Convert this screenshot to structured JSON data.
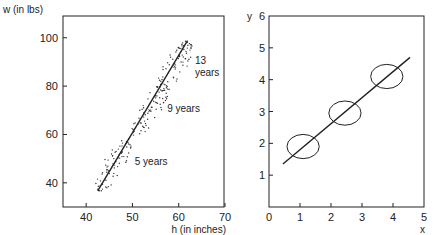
{
  "chart_data": [
    {
      "type": "scatter",
      "title": "",
      "xlabel": "h (in inches)",
      "ylabel": "w (in lbs)",
      "xlim": [
        35,
        70
      ],
      "ylim": [
        30,
        109
      ],
      "xticks": [
        40,
        50,
        60,
        70
      ],
      "yticks": [
        40,
        60,
        80,
        100
      ],
      "grid": false,
      "legend": null,
      "clusters": [
        {
          "label": "5 years",
          "center_h": 46,
          "center_w": 47.5,
          "spread_h": 3.2,
          "spread_w": 9,
          "count": 70
        },
        {
          "label": "9 years",
          "center_h": 53.8,
          "center_w": 70,
          "spread_h": 3.2,
          "spread_w": 10,
          "count": 70
        },
        {
          "label": "13 years",
          "center_h": 59.2,
          "center_w": 88,
          "spread_h": 3.2,
          "spread_w": 11,
          "count": 70
        }
      ],
      "regression_line": {
        "x": [
          42.5,
          61.9
        ],
        "y": [
          36.7,
          98.8
        ]
      },
      "annotations": [
        {
          "text": "5 years",
          "h": 50.5,
          "w": 47.5
        },
        {
          "text": "9 years",
          "h": 57.5,
          "w": 69.5
        },
        {
          "text": "13",
          "h": 63.5,
          "w": 89
        },
        {
          "text": "years",
          "h": 63.5,
          "w": 84
        }
      ]
    },
    {
      "type": "line",
      "title": "",
      "xlabel": "x",
      "ylabel": "y",
      "xlim": [
        0,
        5
      ],
      "ylim": [
        0,
        6
      ],
      "xticks": [
        0,
        1,
        2,
        3,
        4,
        5
      ],
      "yticks": [
        1,
        2,
        3,
        4,
        5,
        6
      ],
      "grid": false,
      "legend": null,
      "regression_line": {
        "x": [
          0.45,
          4.55
        ],
        "y": [
          1.35,
          4.7
        ]
      },
      "ellipses": [
        {
          "cx": 1.1,
          "cy": 1.9,
          "rx": 0.52,
          "ry": 0.38
        },
        {
          "cx": 2.45,
          "cy": 2.95,
          "rx": 0.52,
          "ry": 0.38
        },
        {
          "cx": 3.8,
          "cy": 4.1,
          "rx": 0.52,
          "ry": 0.38
        }
      ]
    }
  ]
}
